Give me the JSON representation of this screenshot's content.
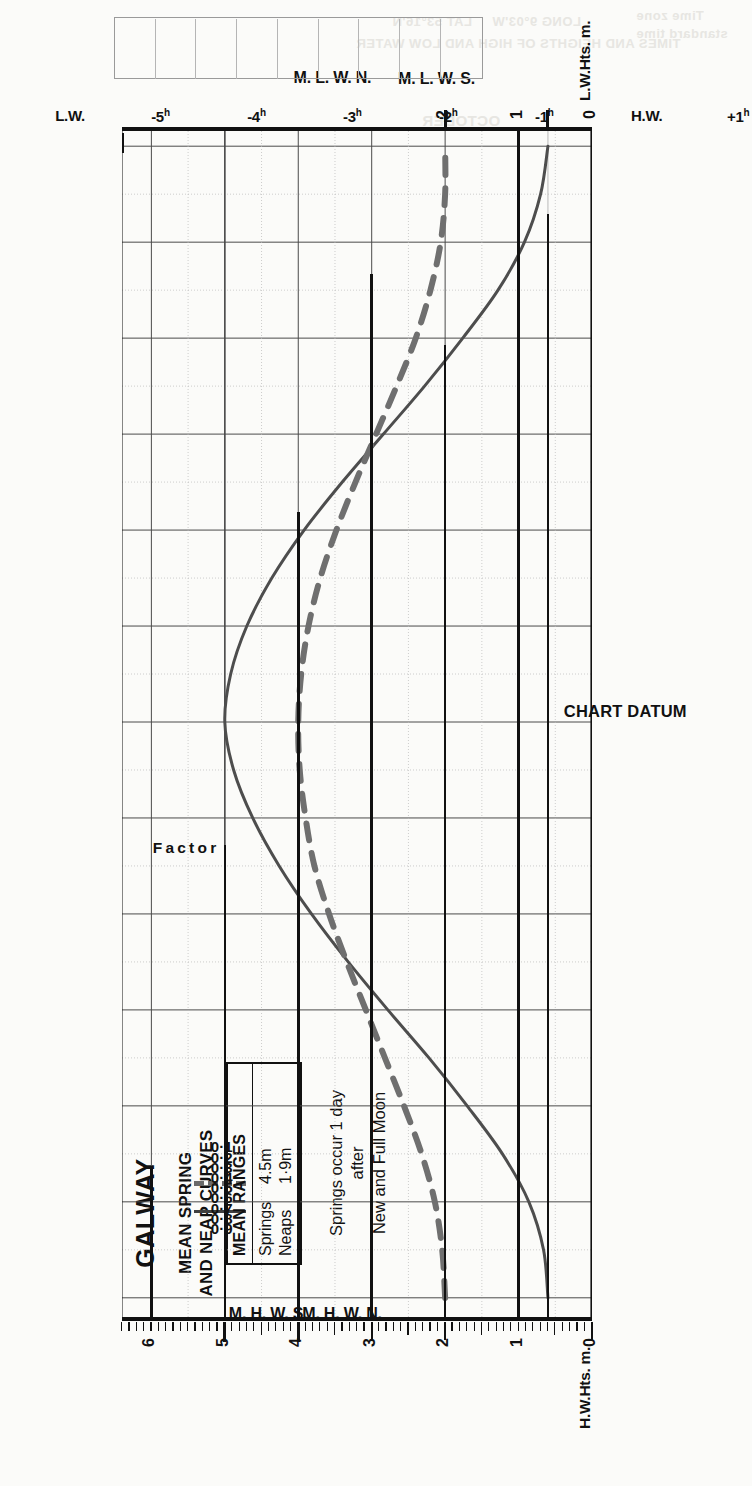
{
  "title": "GALWAY",
  "subtitle_line1": "MEAN SPRING",
  "subtitle_line2": "AND NEAP CURVES",
  "legend": {
    "heading": "MEAN RANGES",
    "rows": [
      {
        "name": "Springs",
        "value": "4.5m",
        "style": "solid"
      },
      {
        "name": "Neaps",
        "value": "1·9m",
        "style": "dashed"
      }
    ]
  },
  "note": {
    "line1": "Springs occur 1 day",
    "line2": "after",
    "line3": "New and Full Moon"
  },
  "axes": {
    "left_title": "H.W.Hts. m.",
    "right_title": "L.W.Hts. m.",
    "factor_caption": "Factor",
    "chart_datum": "CHART DATUM",
    "height_ticks": [
      "0",
      "1",
      "2",
      "3",
      "4",
      "5",
      "6"
    ],
    "factor_ticks": [
      "0·9",
      "0·8",
      "0·7",
      "0·6",
      "0·5",
      "0·4",
      "0·3",
      "0·2",
      "0·1"
    ],
    "hour_ticks": [
      "L.W.",
      "+5h",
      "+4h",
      "+3h",
      "+2h",
      "+1h",
      "H.W.",
      "-1h",
      "-2h",
      "-3h",
      "-4h",
      "-5h",
      "L.W."
    ]
  },
  "level_markers": [
    {
      "label": "M. H. W. S.",
      "height": 5.0,
      "side": "high"
    },
    {
      "label": "M. H. W. N.",
      "height": 4.0,
      "side": "high"
    },
    {
      "label": "M. L. W. N.",
      "height": 2.0,
      "side": "low"
    },
    {
      "label": "M. L. W. S.",
      "height": 0.6,
      "side": "low"
    }
  ],
  "colors": {
    "spring_curve": "#4d4d4d",
    "neap_curve": "#6f6f6f",
    "grid_major": "#4a4a4a",
    "grid_minor": "#b9b9b9",
    "axis": "#111111",
    "background": "#fbfbf9"
  },
  "bleed_text": [
    {
      "text": "LAT 53°16'N",
      "x": 392,
      "y": 14
    },
    {
      "text": "LONG 9°03'W",
      "x": 492,
      "y": 14
    },
    {
      "text": "TIMES AND HEIGHTS OF HIGH AND LOW WATER",
      "x": 356,
      "y": 36
    },
    {
      "text": "Time zone",
      "x": 636,
      "y": 8
    },
    {
      "text": "standard time",
      "x": 636,
      "y": 26
    },
    {
      "text": "OCTOBER",
      "x": 422,
      "y": 112
    }
  ],
  "chart_data": {
    "type": "line",
    "xlabel": "Hours relative to High Water",
    "ylabel": "Height (metres)",
    "xlim": [
      -6.2,
      6.2
    ],
    "ylim": [
      0,
      6.4
    ],
    "grid": true,
    "legend_position": "top-left",
    "x": [
      -6.0,
      -5.5,
      -5.0,
      -4.5,
      -4.0,
      -3.5,
      -3.0,
      -2.5,
      -2.0,
      -1.5,
      -1.0,
      -0.5,
      0.0,
      0.5,
      1.0,
      1.5,
      2.0,
      2.5,
      3.0,
      3.5,
      4.0,
      4.5,
      5.0,
      5.5,
      6.0
    ],
    "series": [
      {
        "name": "Springs",
        "style": "solid",
        "mean_range": 4.5,
        "high_water": 5.0,
        "low_water": 0.6,
        "values": [
          0.6,
          0.66,
          0.86,
          1.22,
          1.7,
          2.22,
          2.78,
          3.32,
          3.82,
          4.26,
          4.62,
          4.88,
          5.0,
          4.92,
          4.7,
          4.36,
          3.92,
          3.4,
          2.84,
          2.28,
          1.76,
          1.28,
          0.92,
          0.7,
          0.6
        ]
      },
      {
        "name": "Neaps",
        "style": "dashed",
        "mean_range": 1.9,
        "high_water": 4.0,
        "low_water": 2.0,
        "values": [
          2.0,
          2.04,
          2.14,
          2.32,
          2.56,
          2.82,
          3.08,
          3.34,
          3.58,
          3.78,
          3.9,
          3.98,
          4.0,
          3.96,
          3.86,
          3.7,
          3.48,
          3.22,
          2.94,
          2.66,
          2.4,
          2.2,
          2.06,
          2.0,
          2.0
        ]
      }
    ],
    "factor_axis": {
      "label": "Factor",
      "ticks": [
        0.9,
        0.8,
        0.7,
        0.6,
        0.5,
        0.4,
        0.3,
        0.2,
        0.1
      ],
      "note": "Factor 1.0 at H.W., 0.0 at L.W."
    },
    "annotations": [
      "M. H. W. S. = 5.0 m",
      "M. H. W. N. = 4.0 m",
      "M. L. W. N. = 2.0 m",
      "M. L. W. S. = 0.6 m",
      "Springs occur 1 day after New and Full Moon"
    ]
  }
}
